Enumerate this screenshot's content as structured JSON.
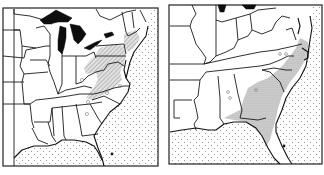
{
  "figure": {
    "panels": [
      {
        "id": "left",
        "description": "Eastern United States distribution map (northern/Appalachian range)",
        "shading": "hatched range along Appalachians from Pennsylvania to northern Georgia",
        "ocean_pattern": "stippled",
        "outlier_markers": 5,
        "point_markers": 1
      },
      {
        "id": "right",
        "description": "Southeastern United States distribution map (coastal plain range)",
        "shading": "stippled range along Atlantic coastal plain from Virginia to Florida",
        "ocean_pattern": "stippled",
        "outlier_markers": 5,
        "point_markers": 1
      }
    ]
  },
  "colors": {
    "line": "#1a1a1a",
    "lake": "#0d0d0d",
    "background": "#ffffff",
    "ocean_dot": "#8a8a8a",
    "range_fill": "#bdbdbd"
  }
}
